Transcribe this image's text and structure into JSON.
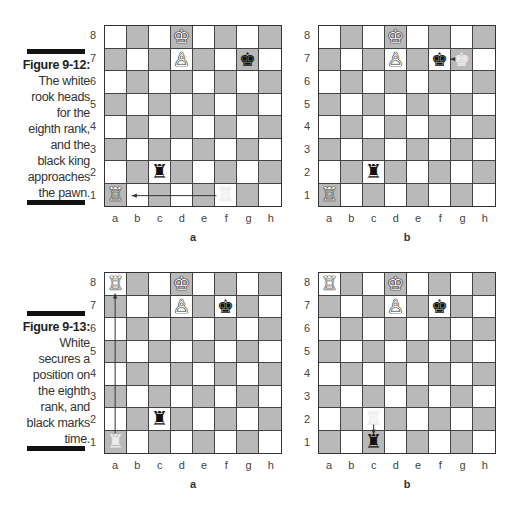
{
  "figures": [
    {
      "id": "9-12",
      "label": "Figure 9-12:",
      "text_lines": [
        "The white",
        "rook heads",
        "for the",
        "eighth rank,",
        "and the",
        "black king",
        "approaches",
        "the pawn."
      ]
    },
    {
      "id": "9-13",
      "label": "Figure 9-13:",
      "text_lines": [
        "White",
        "secures a",
        "position on",
        "the eighth",
        "rank, and",
        "black marks",
        "time."
      ]
    }
  ],
  "files": [
    "a",
    "b",
    "c",
    "d",
    "e",
    "f",
    "g",
    "h"
  ],
  "ranks": [
    "8",
    "7",
    "6",
    "5",
    "4",
    "3",
    "2",
    "1"
  ],
  "colors": {
    "light_square": "#ffffff",
    "dark_square": "#b9b9b9",
    "bar": "#111111"
  },
  "boards": [
    {
      "caption": "a",
      "pieces": [
        {
          "square": "d8",
          "piece": "white-king",
          "glyph": "♔"
        },
        {
          "square": "d7",
          "piece": "white-pawn",
          "glyph": "♙"
        },
        {
          "square": "g7",
          "piece": "black-king",
          "glyph": "♚"
        },
        {
          "square": "c2",
          "piece": "black-rook",
          "glyph": "♜"
        },
        {
          "square": "a1",
          "piece": "white-rook",
          "glyph": "♖"
        },
        {
          "square": "f1",
          "piece": "ghost-white-rook",
          "glyph": "♜",
          "ghost": true
        }
      ],
      "arrow": {
        "from": "f1",
        "to": "b1"
      }
    },
    {
      "caption": "b",
      "pieces": [
        {
          "square": "d8",
          "piece": "white-king",
          "glyph": "♔"
        },
        {
          "square": "d7",
          "piece": "white-pawn",
          "glyph": "♙"
        },
        {
          "square": "f7",
          "piece": "black-king",
          "glyph": "♚"
        },
        {
          "square": "g7",
          "piece": "ghost-black-king",
          "glyph": "♚",
          "ghost": true
        },
        {
          "square": "c2",
          "piece": "black-rook",
          "glyph": "♜"
        },
        {
          "square": "a1",
          "piece": "white-rook",
          "glyph": "♖"
        }
      ],
      "arrow": {
        "from": "g7",
        "to": "f7"
      }
    },
    {
      "caption": "a",
      "pieces": [
        {
          "square": "a8",
          "piece": "white-rook",
          "glyph": "♖"
        },
        {
          "square": "d8",
          "piece": "white-king",
          "glyph": "♔"
        },
        {
          "square": "d7",
          "piece": "white-pawn",
          "glyph": "♙"
        },
        {
          "square": "f7",
          "piece": "black-king",
          "glyph": "♚"
        },
        {
          "square": "c2",
          "piece": "black-rook",
          "glyph": "♜"
        },
        {
          "square": "a1",
          "piece": "ghost-white-rook",
          "glyph": "♜",
          "ghost": true
        }
      ],
      "arrow": {
        "from": "a1",
        "to": "a8"
      }
    },
    {
      "caption": "b",
      "pieces": [
        {
          "square": "a8",
          "piece": "white-rook",
          "glyph": "♖"
        },
        {
          "square": "d8",
          "piece": "white-king",
          "glyph": "♔"
        },
        {
          "square": "d7",
          "piece": "white-pawn",
          "glyph": "♙"
        },
        {
          "square": "f7",
          "piece": "black-king",
          "glyph": "♚"
        },
        {
          "square": "c2",
          "piece": "ghost-black-rook",
          "glyph": "♜",
          "ghost": true
        },
        {
          "square": "c1",
          "piece": "black-rook",
          "glyph": "♜"
        }
      ],
      "arrow": {
        "from": "c2",
        "to": "c1"
      }
    }
  ]
}
